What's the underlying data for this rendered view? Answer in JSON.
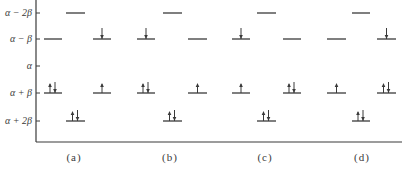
{
  "diagram": {
    "type": "huckel-energy-level-diagram",
    "y_axis": {
      "levels": [
        {
          "key": "a-2b",
          "label": "α − 2β",
          "y": 13
        },
        {
          "key": "a-b",
          "label": "α − β",
          "y": 39
        },
        {
          "key": "a",
          "label": "α",
          "y": 66
        },
        {
          "key": "a+b",
          "label": "α + β",
          "y": 93
        },
        {
          "key": "a+2b",
          "label": "α + 2β",
          "y": 121
        }
      ]
    },
    "configurations": [
      {
        "label": "(a)",
        "center_x": 74,
        "columns": [
          {
            "x1": 44,
            "x2": 62,
            "levels": [
              {
                "key": "a-b",
                "electrons": ""
              },
              {
                "key": "a+b",
                "electrons": "updown"
              }
            ]
          },
          {
            "x1": 66,
            "x2": 85,
            "levels": [
              {
                "key": "a-2b",
                "electrons": ""
              },
              {
                "key": "a+2b",
                "electrons": "updown"
              }
            ]
          },
          {
            "x1": 93,
            "x2": 111,
            "levels": [
              {
                "key": "a-b",
                "electrons": "down"
              },
              {
                "key": "a+b",
                "electrons": "up"
              }
            ]
          }
        ]
      },
      {
        "label": "(b)",
        "center_x": 170,
        "columns": [
          {
            "x1": 137,
            "x2": 155,
            "levels": [
              {
                "key": "a-b",
                "electrons": "down"
              },
              {
                "key": "a+b",
                "electrons": "updown"
              }
            ]
          },
          {
            "x1": 163,
            "x2": 182,
            "levels": [
              {
                "key": "a-2b",
                "electrons": ""
              },
              {
                "key": "a+2b",
                "electrons": "updown"
              }
            ]
          },
          {
            "x1": 188,
            "x2": 207,
            "levels": [
              {
                "key": "a-b",
                "electrons": ""
              },
              {
                "key": "a+b",
                "electrons": "up"
              }
            ]
          }
        ]
      },
      {
        "label": "(c)",
        "center_x": 265,
        "columns": [
          {
            "x1": 232,
            "x2": 250,
            "levels": [
              {
                "key": "a-b",
                "electrons": "down"
              },
              {
                "key": "a+b",
                "electrons": "up"
              }
            ]
          },
          {
            "x1": 257,
            "x2": 276,
            "levels": [
              {
                "key": "a-2b",
                "electrons": ""
              },
              {
                "key": "a+2b",
                "electrons": "updown"
              }
            ]
          },
          {
            "x1": 283,
            "x2": 301,
            "levels": [
              {
                "key": "a-b",
                "electrons": ""
              },
              {
                "key": "a+b",
                "electrons": "updown"
              }
            ]
          }
        ]
      },
      {
        "label": "(d)",
        "center_x": 362,
        "columns": [
          {
            "x1": 327,
            "x2": 346,
            "levels": [
              {
                "key": "a-b",
                "electrons": ""
              },
              {
                "key": "a+b",
                "electrons": "up"
              }
            ]
          },
          {
            "x1": 352,
            "x2": 370,
            "levels": [
              {
                "key": "a-2b",
                "electrons": ""
              },
              {
                "key": "a+2b",
                "electrons": "updown"
              }
            ]
          },
          {
            "x1": 377,
            "x2": 396,
            "levels": [
              {
                "key": "a-b",
                "electrons": "down"
              },
              {
                "key": "a+b",
                "electrons": "updown"
              }
            ]
          }
        ]
      }
    ],
    "colors": {
      "line": "#3a3a3a",
      "background": "#ffffff"
    }
  }
}
